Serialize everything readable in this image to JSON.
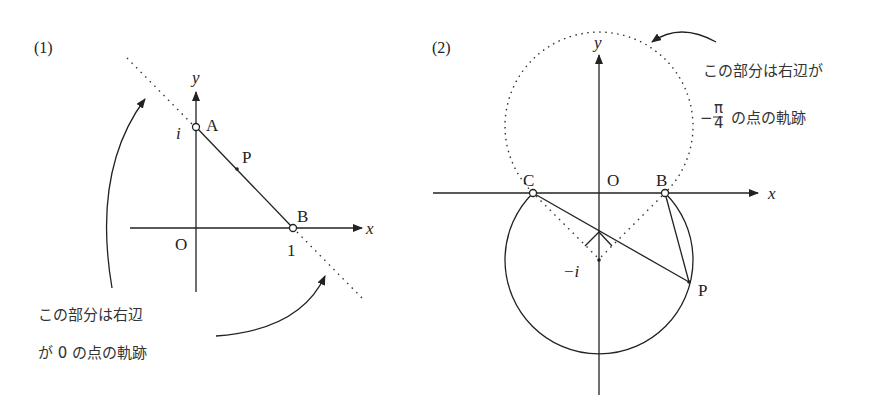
{
  "panel1": {
    "label": "(1)",
    "axis_x": "x",
    "axis_y": "y",
    "origin": "O",
    "point_a": "A",
    "point_b": "B",
    "point_p": "P",
    "tick_i": "i",
    "tick_1": "1",
    "note_line1": "この部分は右辺",
    "note_line2": "が 0 の点の軌跡"
  },
  "panel2": {
    "label": "(2)",
    "axis_x": "x",
    "axis_y": "y",
    "origin": "O",
    "point_b": "B",
    "point_c": "C",
    "point_p": "P",
    "tick_minus_i": "−i",
    "note_line1": "この部分は右辺が",
    "note_minus": "−",
    "note_pi": "π",
    "note_4": "4",
    "note_line2_rest": "の点の軌跡"
  },
  "colors": {
    "ink": "#222222",
    "background": "#ffffff"
  }
}
